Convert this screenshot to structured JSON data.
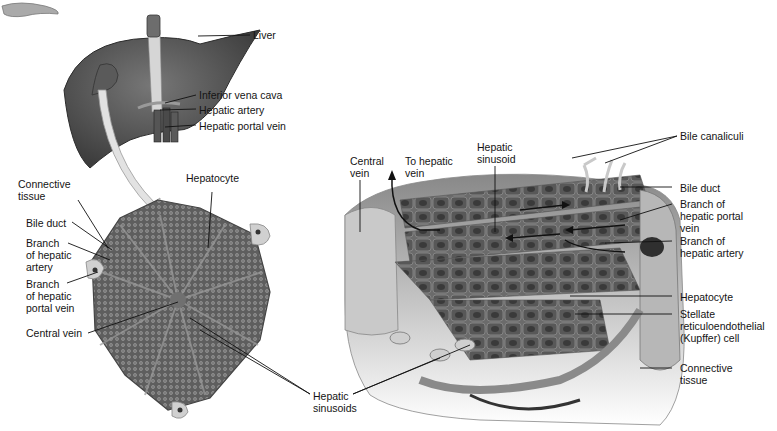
{
  "figure": {
    "liver_labels": {
      "liver": "Liver",
      "ivc": "Inferior vena cava",
      "hepatic_artery": "Hepatic artery",
      "portal_vein": "Hepatic portal vein"
    },
    "lobule_labels": {
      "connective_tissue": "Connective\ntissue",
      "hepatocyte": "Hepatocyte",
      "bile_duct": "Bile duct",
      "branch_artery": "Branch\nof hepatic\nartery",
      "branch_portal": "Branch\nof hepatic\nportal vein",
      "central_vein": "Central vein",
      "sinusoids": "Hepatic\nsinusoids"
    },
    "detail_labels": {
      "central_vein": "Central\nvein",
      "to_hepatic_vein": "To hepatic\nvein",
      "hepatic_sinusoid": "Hepatic\nsinusoid",
      "bile_canaliculi": "Bile canaliculi",
      "bile_duct": "Bile duct",
      "branch_portal": "Branch of\nhepatic portal\nvein",
      "branch_artery": "Branch of\nhepatic artery",
      "hepatocyte": "Hepatocyte",
      "kupffer": "Stellate\nreticuloendothelial\n(Kupffer) cell",
      "connective_tissue": "Connective\ntissue"
    },
    "colors": {
      "tissue_dark": "#4a4a4a",
      "tissue_mid": "#7a7a7a",
      "tissue_light": "#bdbdbd",
      "arrow_fill": "#e2e2e2",
      "leader_line": "#111111"
    }
  }
}
